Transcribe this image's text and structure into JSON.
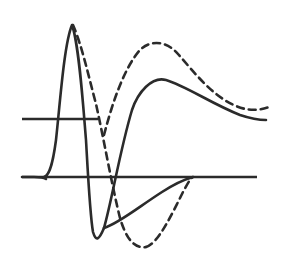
{
  "figure": {
    "title": "",
    "background_color": "#ffffff",
    "width": 287,
    "height": 258,
    "line_color": "#2b2b2b",
    "line_width": 2.6,
    "dash_pattern": "7,5"
  },
  "chart_data": {
    "type": "line",
    "title": "",
    "subtitle": "",
    "xlabel": "",
    "ylabel": "",
    "xlim": [
      0,
      287
    ],
    "ylim": [
      258,
      0
    ],
    "grid": false,
    "legend": null,
    "axes": {
      "upper_baseline": {
        "label": "upper-baseline",
        "y": 119,
        "x_start": 22,
        "x_end": 98,
        "style": "solid"
      },
      "lower_baseline": {
        "label": "lower-baseline",
        "y": 177,
        "x_start": 22,
        "x_end": 257,
        "style": "solid"
      }
    },
    "series": [
      {
        "name": "solid-sharp-peak",
        "style": "solid",
        "color": "#2b2b2b",
        "peak_x": 72,
        "peak_y": 24,
        "trough_x": 88,
        "trough_y": 240,
        "path": "M 44,177 C 48,176 52,170 56,140 C 60,104 64,44 72,25 C 79,44 83,104 86,140 C 88,175 90,215 93,232 C 96,242 99,240 104,228",
        "points": [
          [
            44,
            177
          ],
          [
            50,
            172
          ],
          [
            56,
            140
          ],
          [
            62,
            78
          ],
          [
            68,
            36
          ],
          [
            72,
            25
          ],
          [
            76,
            34
          ],
          [
            80,
            70
          ],
          [
            86,
            140
          ],
          [
            90,
            200
          ],
          [
            93,
            232
          ],
          [
            99,
            240
          ],
          [
            104,
            228
          ]
        ]
      },
      {
        "name": "solid-broad-band",
        "style": "solid",
        "color": "#2b2b2b",
        "peak_x": 143,
        "peak_y": 79,
        "path": "M 104,228 C 112,200 120,150 132,110 C 138,92 152,76 166,80 C 186,86 212,104 240,115 C 252,119 260,120 266,120",
        "points": [
          [
            104,
            228
          ],
          [
            112,
            200
          ],
          [
            122,
            156
          ],
          [
            132,
            110
          ],
          [
            143,
            79
          ],
          [
            156,
            77
          ],
          [
            170,
            82
          ],
          [
            190,
            92
          ],
          [
            212,
            104
          ],
          [
            240,
            115
          ],
          [
            266,
            120
          ]
        ]
      },
      {
        "name": "dashed-sharp-peak",
        "style": "dashed",
        "color": "#2b2b2b",
        "peak_x": 73,
        "peak_y": 25,
        "trough_x": 98,
        "trough_y": 247,
        "path": "M 73,25 C 82,46 88,74 96,104 C 104,140 112,186 120,218 C 126,238 134,249 146,247",
        "points": [
          [
            73,
            25
          ],
          [
            82,
            50
          ],
          [
            90,
            82
          ],
          [
            98,
            112
          ],
          [
            108,
            156
          ],
          [
            116,
            196
          ],
          [
            124,
            228
          ],
          [
            134,
            247
          ],
          [
            146,
            247
          ]
        ]
      },
      {
        "name": "dashed-broad-band",
        "style": "dashed",
        "color": "#2b2b2b",
        "peak_x": 156,
        "peak_y": 43,
        "path": "M 104,135 C 112,104 124,68 140,50 C 150,40 166,40 178,54 C 194,72 212,96 236,106 C 250,112 262,110 272,106",
        "points": [
          [
            104,
            135
          ],
          [
            114,
            100
          ],
          [
            126,
            66
          ],
          [
            140,
            50
          ],
          [
            156,
            43
          ],
          [
            170,
            48
          ],
          [
            184,
            62
          ],
          [
            204,
            86
          ],
          [
            226,
            102
          ],
          [
            250,
            110
          ],
          [
            272,
            106
          ]
        ]
      },
      {
        "name": "dashed-lower-return",
        "style": "dashed",
        "color": "#2b2b2b",
        "peak_x": 192,
        "peak_y": 177,
        "path": "M 146,247 C 158,244 172,214 184,190 C 188,183 190,179 193,177",
        "points": [
          [
            146,
            247
          ],
          [
            158,
            236
          ],
          [
            172,
            212
          ],
          [
            184,
            190
          ],
          [
            193,
            177
          ]
        ]
      },
      {
        "name": "solid-lower-return",
        "style": "solid",
        "color": "#2b2b2b",
        "peak_x": 192,
        "peak_y": 177,
        "path": "M 104,228 C 118,224 140,206 162,192 C 176,183 186,179 193,177",
        "points": [
          [
            104,
            228
          ],
          [
            122,
            220
          ],
          [
            142,
            205
          ],
          [
            162,
            192
          ],
          [
            178,
            182
          ],
          [
            193,
            177
          ]
        ]
      },
      {
        "name": "solid-left-foot",
        "style": "solid",
        "color": "#2b2b2b",
        "peak_x": 30,
        "peak_y": 177,
        "path": "M 22,177 L 34,177 C 40,177 43,177 46,179",
        "points": [
          [
            22,
            177
          ],
          [
            34,
            177
          ],
          [
            46,
            179
          ]
        ]
      }
    ],
    "annotations": [],
    "convergence_point": {
      "x": 192,
      "y": 177,
      "label": "curves-converge"
    }
  }
}
